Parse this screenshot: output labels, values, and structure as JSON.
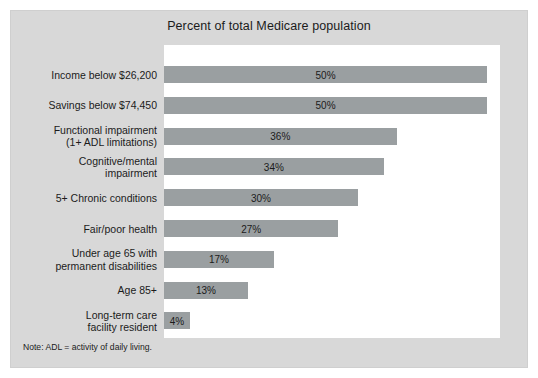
{
  "figure": {
    "title": "Percent of total Medicare population",
    "note": "Note: ADL = activity of daily living.",
    "colors": {
      "background": "#d8d8d8",
      "panel": "#ffffff",
      "bar": "#9a9fa1",
      "text": "#1b1b1b"
    }
  },
  "chart_data": {
    "type": "bar",
    "orientation": "horizontal",
    "title": "Percent of total Medicare population",
    "xlabel": "",
    "ylabel": "",
    "xlim": [
      0,
      52
    ],
    "grid": false,
    "legend": false,
    "value_suffix": "%",
    "categories": [
      "Income below $26,200",
      "Savings below $74,450",
      "Functional impairment\n(1+ ADL limitations)",
      "Cognitive/mental\nimpairment",
      "5+ Chronic conditions",
      "Fair/poor health",
      "Under age 65 with\npermanent disabilities",
      "Age 85+",
      "Long-term care\nfacility resident"
    ],
    "values": [
      50,
      50,
      36,
      34,
      30,
      27,
      17,
      13,
      4
    ],
    "value_labels": [
      "50%",
      "50%",
      "36%",
      "34%",
      "30%",
      "27%",
      "17%",
      "13%",
      "4%"
    ],
    "annotation": "Note: ADL = activity of daily living."
  }
}
